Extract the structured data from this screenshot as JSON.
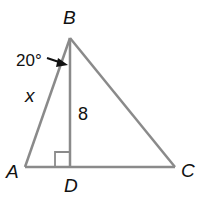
{
  "diagram": {
    "vertices": {
      "A": {
        "label": "A"
      },
      "B": {
        "label": "B"
      },
      "C": {
        "label": "C"
      },
      "D": {
        "label": "D"
      }
    },
    "side_label_AB": "x",
    "altitude_label_BD": "8",
    "angle_label": "20°",
    "colors": {
      "line": "#8a8a8a",
      "text": "#111111"
    }
  }
}
